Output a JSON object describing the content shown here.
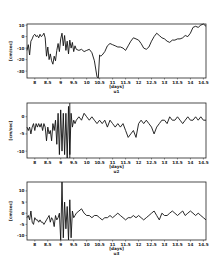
{
  "chart_data": [
    {
      "type": "line",
      "panel": "u1",
      "title": "u1",
      "xlabel": "[days]",
      "ylabel": "[cm/sec]",
      "xlim": [
        7.7,
        14.6
      ],
      "ylim": [
        -36,
        11
      ],
      "xticks": [
        8,
        8.5,
        9,
        9.5,
        10,
        10.5,
        11,
        11.5,
        12,
        12.5,
        13,
        13.5,
        14,
        14.5
      ],
      "xtick_labels": [
        "8",
        "8.5",
        "9",
        "9.5",
        "10",
        "10.5",
        "11",
        "11.5",
        "12",
        "12.5",
        "13",
        "13.5",
        "14",
        "14.5"
      ],
      "yticks": [
        10,
        0,
        -10,
        -20,
        -30
      ],
      "ytick_labels": [
        "10",
        "0",
        "-10",
        "-20",
        "-30"
      ],
      "grid": false,
      "x": [
        7.7,
        7.75,
        7.8,
        7.85,
        7.9,
        7.95,
        8.0,
        8.05,
        8.1,
        8.15,
        8.2,
        8.25,
        8.3,
        8.35,
        8.4,
        8.45,
        8.5,
        8.55,
        8.6,
        8.65,
        8.7,
        8.75,
        8.8,
        8.85,
        8.9,
        8.95,
        9.0,
        9.05,
        9.1,
        9.15,
        9.2,
        9.25,
        9.3,
        9.35,
        9.4,
        9.45,
        9.5,
        9.55,
        9.6,
        9.7,
        9.8,
        9.9,
        10.0,
        10.1,
        10.2,
        10.3,
        10.4,
        10.45,
        10.5,
        10.55,
        10.6,
        10.7,
        10.8,
        10.9,
        11.0,
        11.1,
        11.2,
        11.3,
        11.4,
        11.5,
        11.6,
        11.7,
        11.8,
        11.9,
        12.0,
        12.1,
        12.2,
        12.3,
        12.4,
        12.5,
        12.6,
        12.7,
        12.8,
        12.9,
        13.0,
        13.1,
        13.2,
        13.3,
        13.4,
        13.5,
        13.6,
        13.7,
        13.8,
        13.9,
        14.0,
        14.1,
        14.2,
        14.3,
        14.4,
        14.5,
        14.6
      ],
      "values": [
        -12,
        -7,
        -16,
        -4,
        -2,
        1,
        2,
        0,
        1,
        -1,
        2,
        0,
        1,
        3,
        -1,
        -17,
        -9,
        -20,
        -15,
        -21,
        -24,
        -17,
        -21,
        -12,
        -6,
        -13,
        -2,
        3,
        -8,
        1,
        -12,
        -4,
        -15,
        -3,
        -10,
        -5,
        -13,
        -8,
        -11,
        -12,
        -11,
        -13,
        -12,
        -11,
        -14,
        -21,
        -35,
        -36,
        -16,
        -17,
        -16,
        -13,
        -8,
        -6,
        -7,
        -8,
        -9,
        -9,
        -10,
        -12,
        -8,
        -4,
        -1,
        -2,
        -3,
        -6,
        -10,
        -11,
        -9,
        -4,
        0,
        3,
        1,
        -1,
        -2,
        -4,
        -5,
        -3,
        -3,
        -2,
        -2,
        -1,
        1,
        0,
        3,
        8,
        9,
        8,
        10,
        11,
        9
      ]
    },
    {
      "type": "line",
      "panel": "u2",
      "title": "u2",
      "xlabel": "[days]",
      "ylabel": "[cm/sec]",
      "xlim": [
        7.7,
        14.6
      ],
      "ylim": [
        -12,
        4
      ],
      "xticks": [
        8,
        8.5,
        9,
        9.5,
        10,
        10.5,
        11,
        11.5,
        12,
        12.5,
        13,
        13.5,
        14,
        14.5
      ],
      "xtick_labels": [
        "8",
        "8.5",
        "9",
        "9.5",
        "10",
        "10.5",
        "11",
        "11.5",
        "12",
        "12.5",
        "13",
        "13.5",
        "14",
        "14.5"
      ],
      "yticks": [
        0,
        -5,
        -10
      ],
      "ytick_labels": [
        "0",
        "-5",
        "-10"
      ],
      "grid": false,
      "x": [
        7.7,
        7.75,
        7.8,
        7.85,
        7.9,
        7.95,
        8.0,
        8.05,
        8.1,
        8.15,
        8.2,
        8.25,
        8.3,
        8.35,
        8.4,
        8.45,
        8.5,
        8.55,
        8.6,
        8.65,
        8.7,
        8.75,
        8.8,
        8.85,
        8.9,
        8.95,
        9.0,
        9.05,
        9.1,
        9.15,
        9.2,
        9.25,
        9.3,
        9.35,
        9.4,
        9.45,
        9.5,
        9.55,
        9.6,
        9.7,
        9.8,
        9.9,
        10.0,
        10.1,
        10.2,
        10.3,
        10.4,
        10.5,
        10.6,
        10.7,
        10.8,
        10.9,
        11.0,
        11.1,
        11.2,
        11.3,
        11.4,
        11.5,
        11.6,
        11.7,
        11.8,
        11.9,
        12.0,
        12.1,
        12.2,
        12.3,
        12.4,
        12.5,
        12.6,
        12.7,
        12.8,
        12.9,
        13.0,
        13.1,
        13.2,
        13.3,
        13.4,
        13.5,
        13.6,
        13.7,
        13.8,
        13.9,
        14.0,
        14.1,
        14.2,
        14.3,
        14.4,
        14.5,
        14.6
      ],
      "values": [
        -3,
        -4,
        -3,
        -5,
        -3,
        -2,
        -4,
        -2,
        -3,
        -2,
        -3,
        -2,
        -4,
        -2,
        -3,
        -7,
        -3,
        -5,
        -4,
        -7,
        -2,
        -4,
        -1,
        -8,
        1,
        -11,
        2,
        -10,
        1,
        -11,
        1,
        -12,
        3,
        -11,
        1,
        -3,
        -1,
        -2,
        -1,
        0,
        -1,
        1,
        0,
        -1,
        0,
        -1,
        -2,
        -1,
        -2,
        -1,
        -3,
        -1,
        -2,
        -3,
        -2,
        -3,
        -2,
        -4,
        -6,
        -5,
        -4,
        -6,
        -2,
        -1,
        -2,
        -1,
        -2,
        -3,
        -5,
        -3,
        -2,
        -1,
        -1,
        -2,
        0,
        -1,
        -1,
        0,
        -1,
        -2,
        -1,
        0,
        -1,
        -1,
        0,
        -1,
        0,
        -1,
        -1,
        -1,
        0
      ],
      "annotations": [
        {
          "type": "vline",
          "x": 9.35
        }
      ]
    },
    {
      "type": "line",
      "panel": "u3",
      "title": "u3",
      "xlabel": "[days]",
      "ylabel": "[cm/sec]",
      "xlim": [
        7.7,
        14.6
      ],
      "ylim": [
        -12,
        14
      ],
      "xticks": [
        8,
        8.5,
        9,
        9.5,
        10,
        10.5,
        11,
        11.5,
        12,
        12.5,
        13,
        13.5,
        14,
        14.5
      ],
      "xtick_labels": [
        "8",
        "8.5",
        "9",
        "9.5",
        "10",
        "10.5",
        "11",
        "11.5",
        "12",
        "12.5",
        "13",
        "13.5",
        "14",
        "14.5"
      ],
      "yticks": [
        10,
        5,
        0,
        -5,
        -10
      ],
      "ytick_labels": [
        "10",
        "5",
        "0",
        "-5",
        "-10"
      ],
      "grid": false,
      "x": [
        7.7,
        7.75,
        7.8,
        7.85,
        7.9,
        7.95,
        8.0,
        8.05,
        8.1,
        8.15,
        8.2,
        8.25,
        8.3,
        8.35,
        8.4,
        8.45,
        8.5,
        8.55,
        8.6,
        8.65,
        8.7,
        8.75,
        8.8,
        8.85,
        8.9,
        8.95,
        9.0,
        9.05,
        9.1,
        9.15,
        9.2,
        9.25,
        9.3,
        9.35,
        9.4,
        9.45,
        9.5,
        9.55,
        9.6,
        9.7,
        9.8,
        9.9,
        10.0,
        10.1,
        10.2,
        10.3,
        10.4,
        10.5,
        10.6,
        10.7,
        10.8,
        10.9,
        11.0,
        11.1,
        11.2,
        11.3,
        11.4,
        11.5,
        11.6,
        11.7,
        11.8,
        11.9,
        12.0,
        12.1,
        12.2,
        12.3,
        12.4,
        12.5,
        12.6,
        12.7,
        12.8,
        12.9,
        13.0,
        13.1,
        13.2,
        13.3,
        13.4,
        13.5,
        13.6,
        13.7,
        13.8,
        13.9,
        14.0,
        14.1,
        14.2,
        14.3,
        14.4,
        14.5,
        14.6
      ],
      "values": [
        -2,
        -1,
        -3,
        1,
        -4,
        -5,
        -2,
        -3,
        -3,
        -4,
        -3,
        -4,
        -4,
        -5,
        -4,
        -3,
        -2,
        -1,
        -4,
        -2,
        -3,
        -6,
        -1,
        -3,
        -2,
        0,
        -12,
        14,
        -11,
        5,
        -7,
        3,
        -12,
        6,
        -11,
        1,
        -2,
        -1,
        0,
        1,
        2,
        0,
        -1,
        -1,
        -2,
        -1,
        -1,
        -2,
        -3,
        -2,
        -2,
        -1,
        -2,
        -1,
        0,
        -1,
        -2,
        -3,
        -2,
        -2,
        -1,
        -2,
        -1,
        -2,
        -3,
        -2,
        -1,
        0,
        1,
        -1,
        -3,
        0,
        -1,
        -1,
        0,
        1,
        0,
        -1,
        0,
        1,
        -1,
        0,
        1,
        0,
        -1,
        0,
        -1,
        -2,
        -3,
        -5,
        -4
      ],
      "annotations": []
    }
  ]
}
